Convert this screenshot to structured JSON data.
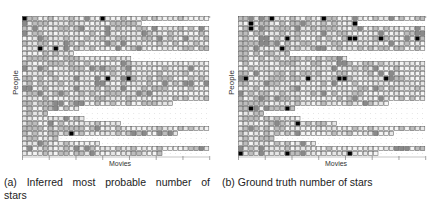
{
  "panels": [
    {
      "id": "a",
      "caption": "(a) Inferred most probable number of stars",
      "xlabel": "Movies",
      "ylabel": "People",
      "row_lengths": [
        36,
        23,
        36,
        36,
        36,
        36,
        36,
        10,
        21,
        36,
        36,
        36,
        36,
        36,
        36,
        36,
        36,
        29,
        11,
        5,
        12,
        19,
        36,
        30,
        7,
        15,
        36,
        27
      ],
      "dark_cells": [
        [
          0,
          0
        ],
        [
          0,
          15
        ],
        [
          6,
          3
        ],
        [
          6,
          6
        ],
        [
          12,
          16
        ],
        [
          12,
          20
        ],
        [
          23,
          9
        ]
      ]
    },
    {
      "id": "b",
      "caption": "(b) Ground truth number of stars",
      "xlabel": "Movies",
      "ylabel": "People",
      "row_lengths": [
        36,
        23,
        36,
        36,
        36,
        36,
        36,
        10,
        21,
        36,
        36,
        36,
        36,
        36,
        36,
        36,
        36,
        29,
        11,
        5,
        12,
        19,
        36,
        30,
        7,
        15,
        36,
        27
      ],
      "dark_cells": [
        [
          0,
          6
        ],
        [
          0,
          16
        ],
        [
          1,
          2
        ],
        [
          1,
          22
        ],
        [
          2,
          2
        ],
        [
          4,
          34
        ],
        [
          4,
          9
        ],
        [
          4,
          21
        ],
        [
          4,
          22
        ],
        [
          4,
          27
        ],
        [
          6,
          8
        ],
        [
          12,
          1
        ],
        [
          12,
          13
        ],
        [
          12,
          19
        ],
        [
          12,
          20
        ],
        [
          12,
          28
        ],
        [
          18,
          2
        ],
        [
          18,
          9
        ],
        [
          18,
          11
        ],
        [
          21,
          11
        ],
        [
          27,
          0
        ],
        [
          27,
          9
        ],
        [
          27,
          21
        ]
      ]
    }
  ],
  "grid": {
    "cols": 36,
    "rows": 28
  },
  "colors": {
    "light": "#e6e6e6",
    "mid": "#bdbdbd",
    "dark": "#8a8a8a",
    "black": "#000000",
    "border": "#555555",
    "dots": "#999999"
  }
}
